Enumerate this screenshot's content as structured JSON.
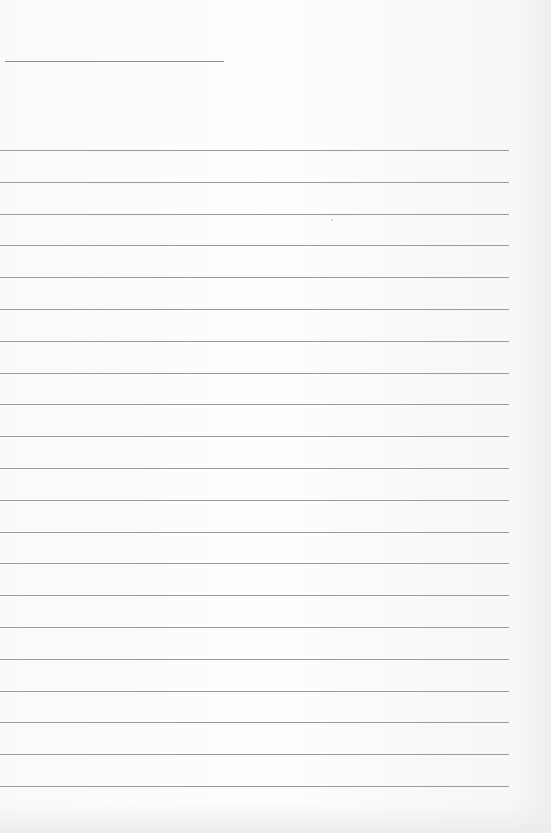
{
  "page": {
    "type": "blank lined paper",
    "background_color": "#fbfbfb",
    "line_color": "#9a9a9a"
  },
  "header": {
    "title_line": {
      "x": 5,
      "y": 61,
      "width": 219,
      "text": ""
    }
  },
  "rules": {
    "count": 21,
    "first_y": 150,
    "spacing": 31.8,
    "width": 509,
    "lines": [
      "",
      "",
      "",
      "",
      "",
      "",
      "",
      "",
      "",
      "",
      "",
      "",
      "",
      "",
      "",
      "",
      "",
      "",
      "",
      "",
      ""
    ]
  }
}
